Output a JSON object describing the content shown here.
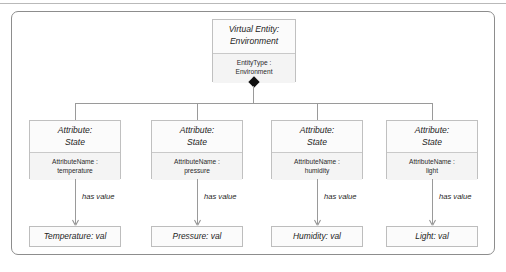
{
  "figure": {
    "root": {
      "header": "Virtual Entity:\nEnvironment",
      "compartment": "EntityType :\nEnvironment"
    },
    "attributes": [
      {
        "header": "Attribute:\nState",
        "compartment": "AttributeName :\ntemperature",
        "edge_label": "has value",
        "value": "Temperature: val"
      },
      {
        "header": "Attribute:\nState",
        "compartment": "AttributeName :\npressure",
        "edge_label": "has value",
        "value": "Pressure: val"
      },
      {
        "header": "Attribute:\nState",
        "compartment": "AttributeName :\nhumidity",
        "edge_label": "has value",
        "value": "Humidity: val"
      },
      {
        "header": "Attribute:\nState",
        "compartment": "AttributeName :\nlight",
        "edge_label": "has value",
        "value": "Light: val"
      }
    ],
    "colors": {
      "frame_border": "#8d8d8d",
      "node_border": "#c0c0c0",
      "node_fill": "#fbfbfb",
      "compartment_fill": "#f4f4f4",
      "connector": "#9a9a9a",
      "diamond": "#111111"
    }
  }
}
